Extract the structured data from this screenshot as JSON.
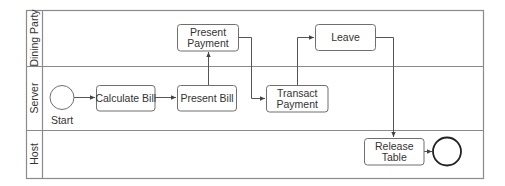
{
  "diagram": {
    "type": "swimlane-process",
    "lanes": [
      {
        "id": "dining_party",
        "label": "Dining Party"
      },
      {
        "id": "server",
        "label": "Server"
      },
      {
        "id": "host",
        "label": "Host"
      }
    ],
    "events": {
      "start": {
        "label": "Start",
        "lane": "server"
      },
      "end": {
        "label": "",
        "lane": "host"
      }
    },
    "tasks": {
      "calculate_bill": {
        "lines": [
          "Calculate Bill"
        ],
        "lane": "server"
      },
      "present_bill": {
        "lines": [
          "Present Bill"
        ],
        "lane": "server"
      },
      "present_payment": {
        "lines": [
          "Present",
          "Payment"
        ],
        "lane": "dining_party"
      },
      "transact_payment": {
        "lines": [
          "Transact",
          "Payment"
        ],
        "lane": "server"
      },
      "leave": {
        "lines": [
          "Leave"
        ],
        "lane": "dining_party"
      },
      "release_table": {
        "lines": [
          "Release",
          "Table"
        ],
        "lane": "host"
      }
    },
    "flows": [
      {
        "from": "start",
        "to": "calculate_bill"
      },
      {
        "from": "calculate_bill",
        "to": "present_bill"
      },
      {
        "from": "present_bill",
        "to": "present_payment"
      },
      {
        "from": "present_payment",
        "to": "transact_payment"
      },
      {
        "from": "transact_payment",
        "to": "leave"
      },
      {
        "from": "leave",
        "to": "release_table"
      },
      {
        "from": "release_table",
        "to": "end"
      }
    ]
  },
  "colors": {
    "frame": "#8a8a8a",
    "task_border": "#6f6f6f",
    "flow": "#555555",
    "end_event": "#222222",
    "text": "#333333"
  }
}
